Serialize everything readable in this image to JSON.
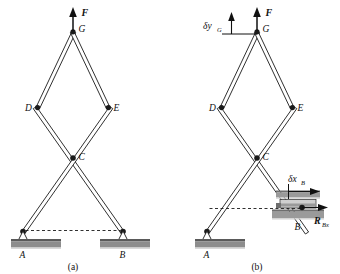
{
  "figure": {
    "background_color": "#ffffff",
    "line_color": "#1a1a1a",
    "ground_color": "#8d8d8d",
    "collar_color": "#9a9a9a"
  },
  "panel_a": {
    "caption": "(a)",
    "joint_labels": {
      "G": "G",
      "D": "D",
      "E": "E",
      "C": "C",
      "A": "A",
      "B": "B"
    },
    "force_label": "F",
    "support_a_type": "pin-support",
    "support_b_type": "pin-support"
  },
  "panel_b": {
    "caption": "(b)",
    "joint_labels": {
      "G": "G",
      "D": "D",
      "E": "E",
      "C": "C",
      "A": "A",
      "B": "B"
    },
    "force_label": "F",
    "virtual_disp_vertical": {
      "symbol": "δy",
      "subscript": "G"
    },
    "virtual_disp_horizontal": {
      "symbol": "δx",
      "subscript": "B"
    },
    "reaction": {
      "symbol": "R",
      "subscript": "Bx"
    },
    "support_a_type": "pin-support",
    "support_b_type": "roller-collar-support"
  }
}
